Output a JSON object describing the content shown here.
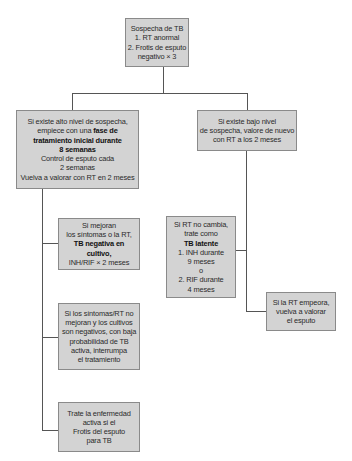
{
  "diagram": {
    "type": "flowchart",
    "colors": {
      "box_fill": "#d3d3d3",
      "box_border": "#8a8a8a",
      "connector": "#555555",
      "text": "#2a2a2a"
    },
    "root": {
      "lines": [
        "Sospecha de TB",
        "1. RT anormal",
        "2. Frotis de esputo",
        "negativo × 3"
      ]
    },
    "high_suspicion": {
      "lines": [
        "Si existe alto nivel de sospecha,",
        "empiece con una",
        "fase de",
        "tratamiento inicial durante",
        "8 semanas",
        "Control de esputo cada",
        "2 semanas",
        "Vuelva a valorar con RT en 2 meses"
      ]
    },
    "low_suspicion": {
      "lines": [
        "Si existe bajo nivel",
        "de sospecha, valore de nuevo",
        "con RT a los 2 meses"
      ]
    },
    "improve": {
      "lines": [
        "Si mejoran",
        "los síntomas o la RT,",
        "TB negativa en cultivo,",
        "INH/RIF × 2 meses"
      ]
    },
    "no_improve": {
      "lines": [
        "Si los síntomas/RT no",
        "mejoran y los cultivos",
        "son negativos, con baja",
        "probabilidad de TB",
        "activa, interrumpa",
        "el  tratamiento"
      ]
    },
    "treat_active": {
      "lines": [
        "Trate la enfermedad",
        "activa si el",
        "Frotis del esputo",
        "para TB"
      ]
    },
    "latent": {
      "lines": [
        "Si RT no cambia,",
        "trate como",
        "TB latente",
        "1. INH durante",
        "9 meses",
        "o",
        "2. RIF durante",
        "4 meses"
      ]
    },
    "worsens": {
      "lines": [
        "Si la RT empeora,",
        "vuelva a valorar",
        "el esputo"
      ]
    }
  }
}
